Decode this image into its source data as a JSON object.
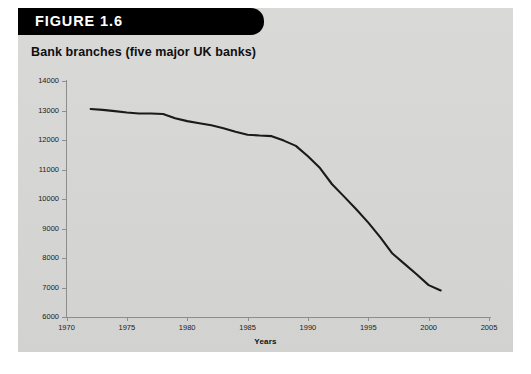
{
  "figure": {
    "banner_label": "FIGURE 1.6",
    "banner_color": "#000000",
    "banner_text_color": "#ffffff",
    "panel_color": "#d7d7d5",
    "title": "Bank branches (five major UK banks)"
  },
  "chart_data": {
    "type": "line",
    "title": "Bank branches (five major UK banks)",
    "xlabel": "Years",
    "ylabel": "",
    "xlim": [
      1970,
      2005
    ],
    "ylim": [
      6000,
      14000
    ],
    "grid": false,
    "legend": "none",
    "line_color": "#1a1a1a",
    "line_width": 2.1,
    "x_ticks": [
      1970,
      1975,
      1980,
      1985,
      1990,
      1995,
      2000,
      2005
    ],
    "y_ticks": [
      6000,
      7000,
      8000,
      9000,
      10000,
      11000,
      12000,
      13000,
      14000
    ],
    "y_tick_labels": [
      "6000",
      "7000",
      "8000",
      "9000",
      "10000",
      "11000",
      "12000",
      "13000",
      "14000"
    ],
    "x_tick_labels": [
      "1970",
      "1975",
      "1980",
      "1985",
      "1990",
      "1995",
      "2000",
      "2005"
    ],
    "series": [
      {
        "name": "Bank branches (five major UK banks)",
        "x": [
          1972,
          1973,
          1974,
          1975,
          1976,
          1977,
          1978,
          1979,
          1980,
          1981,
          1982,
          1983,
          1984,
          1985,
          1986,
          1987,
          1988,
          1989,
          1990,
          1991,
          1992,
          1993,
          1994,
          1995,
          1996,
          1997,
          1998,
          1999,
          2000,
          2001
        ],
        "values": [
          13050,
          13020,
          12980,
          12930,
          12900,
          12900,
          12880,
          12740,
          12640,
          12570,
          12500,
          12400,
          12280,
          12180,
          12150,
          12130,
          11980,
          11800,
          11450,
          11050,
          10500,
          10080,
          9650,
          9200,
          8700,
          8150,
          7800,
          7450,
          7080,
          6900
        ]
      }
    ]
  }
}
